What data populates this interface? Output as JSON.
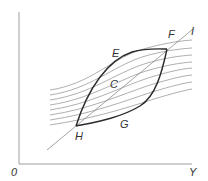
{
  "diagram": {
    "type": "economics-lens-diagram",
    "axes": {
      "origin_label": "0",
      "x_label": "Y",
      "y_label": ""
    },
    "points": {
      "E": "E",
      "F": "F",
      "G": "G",
      "H": "H",
      "C": "C"
    },
    "line_label": "I",
    "indifference_curve_count": 8,
    "colors": {
      "axis": "#9a9a9a",
      "curves": "#8c8c8c",
      "lens": "#2a2a2a",
      "diagonal": "#8c8c8c",
      "text": "#333333"
    }
  }
}
